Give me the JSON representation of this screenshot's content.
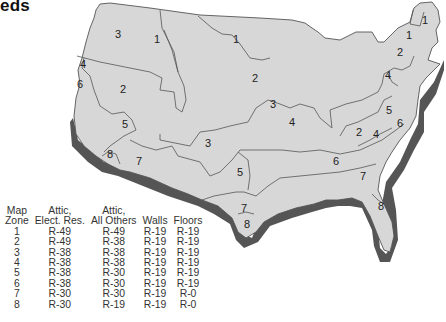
{
  "title": "eds",
  "map": {
    "fill_color": "#d7d7d7",
    "border_color": "#555555",
    "shadow_color": "#555555",
    "zone_labels": [
      {
        "zone": "3",
        "x": 118,
        "y": 38
      },
      {
        "zone": "1",
        "x": 157,
        "y": 43
      },
      {
        "zone": "1",
        "x": 236,
        "y": 43
      },
      {
        "zone": "4",
        "x": 83,
        "y": 68
      },
      {
        "zone": "6",
        "x": 80,
        "y": 88
      },
      {
        "zone": "2",
        "x": 123,
        "y": 93
      },
      {
        "zone": "2",
        "x": 255,
        "y": 82
      },
      {
        "zone": "1",
        "x": 425,
        "y": 24
      },
      {
        "zone": "1",
        "x": 409,
        "y": 39
      },
      {
        "zone": "2",
        "x": 400,
        "y": 56
      },
      {
        "zone": "4",
        "x": 388,
        "y": 79
      },
      {
        "zone": "5",
        "x": 125,
        "y": 128
      },
      {
        "zone": "3",
        "x": 273,
        "y": 108
      },
      {
        "zone": "4",
        "x": 292,
        "y": 126
      },
      {
        "zone": "5",
        "x": 389,
        "y": 114
      },
      {
        "zone": "6",
        "x": 400,
        "y": 127
      },
      {
        "zone": "2",
        "x": 359,
        "y": 136
      },
      {
        "zone": "4",
        "x": 376,
        "y": 138
      },
      {
        "zone": "8",
        "x": 110,
        "y": 158
      },
      {
        "zone": "7",
        "x": 139,
        "y": 165
      },
      {
        "zone": "3",
        "x": 208,
        "y": 147
      },
      {
        "zone": "5",
        "x": 240,
        "y": 176
      },
      {
        "zone": "6",
        "x": 336,
        "y": 165
      },
      {
        "zone": "7",
        "x": 363,
        "y": 180
      },
      {
        "zone": "7",
        "x": 244,
        "y": 212
      },
      {
        "zone": "8",
        "x": 247,
        "y": 228
      },
      {
        "zone": "8",
        "x": 381,
        "y": 210
      }
    ]
  },
  "table": {
    "headers": [
      [
        "Map",
        "Zone"
      ],
      [
        "Attic,",
        "Elect. Res."
      ],
      [
        "Attic,",
        "All Others"
      ],
      [
        "",
        "Walls"
      ],
      [
        "",
        "Floors"
      ]
    ],
    "rows": [
      [
        "1",
        "R-49",
        "R-49",
        "R-19",
        "R-19"
      ],
      [
        "2",
        "R-49",
        "R-38",
        "R-19",
        "R-19"
      ],
      [
        "3",
        "R-38",
        "R-38",
        "R-19",
        "R-19"
      ],
      [
        "4",
        "R-38",
        "R-38",
        "R-19",
        "R-19"
      ],
      [
        "5",
        "R-38",
        "R-30",
        "R-19",
        "R-19"
      ],
      [
        "6",
        "R-38",
        "R-30",
        "R-19",
        "R-19"
      ],
      [
        "7",
        "R-30",
        "R-30",
        "R-19",
        "R-0"
      ],
      [
        "8",
        "R-30",
        "R-19",
        "R-19",
        "R-0"
      ]
    ]
  }
}
